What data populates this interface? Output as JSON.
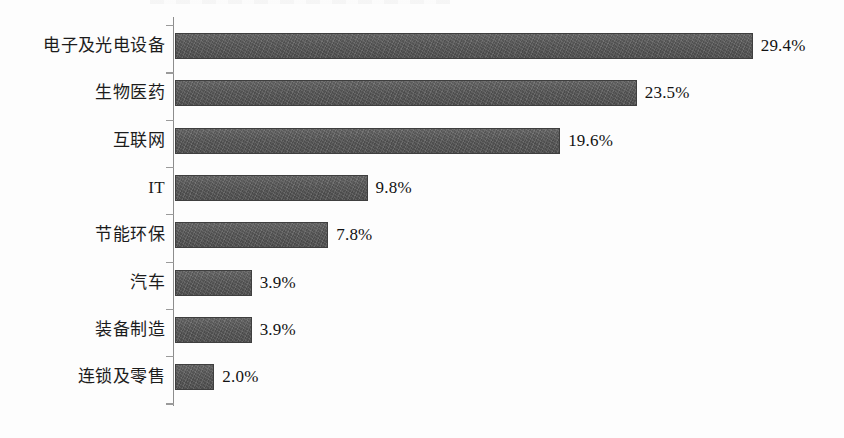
{
  "chart_data": {
    "type": "bar",
    "orientation": "horizontal",
    "title": "",
    "subtitle": "",
    "xlabel": "",
    "ylabel": "",
    "grid": false,
    "legend": null,
    "xlim": [
      0,
      33
    ],
    "unit": "%",
    "axis_color": "#8d8d8d",
    "bar_color": "#5a5a5a",
    "categories": [
      "电子及光电设备",
      "生物医药",
      "互联网",
      "IT",
      "节能环保",
      "汽车",
      "装备制造",
      "连锁及零售"
    ],
    "values": [
      29.4,
      23.5,
      19.6,
      9.8,
      7.8,
      3.9,
      3.9,
      2.0
    ],
    "data_labels": [
      "29.4%",
      "23.5%",
      "19.6%",
      "9.8%",
      "7.8%",
      "3.9%",
      "3.9%",
      "2.0%"
    ]
  }
}
